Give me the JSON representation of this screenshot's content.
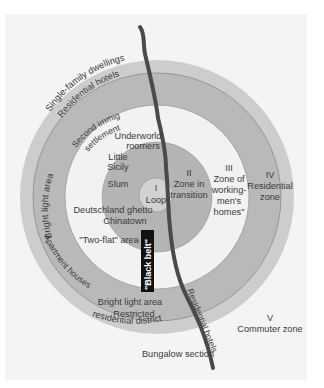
{
  "diagram": {
    "colors": {
      "page_bg": "#ffffff",
      "panel_bg": "#f4f4f4",
      "outer_band": "#cdcdcd",
      "zone_iv": "#b9b9b9",
      "zone_iii": "#f2f2f2",
      "zone_ii": "#b4b4b4",
      "loop": "#d2d2d2",
      "river": "#4a4a4a",
      "black_belt": "#111111",
      "text": "#3a3a3a"
    },
    "zones": [
      {
        "id": "I",
        "numeral": "I",
        "name": "Loop"
      },
      {
        "id": "II",
        "numeral": "II",
        "name_line1": "Zone in",
        "name_line2": "transition"
      },
      {
        "id": "III",
        "numeral": "III",
        "name_line1": "Zone of",
        "name_line2": "working-",
        "name_line3": "men's",
        "name_line4": "homes\""
      },
      {
        "id": "IV",
        "numeral": "IV",
        "name_line1": "Residential",
        "name_line2": "zone"
      },
      {
        "id": "V",
        "numeral": "V",
        "name": "Commuter zone"
      }
    ],
    "areas": {
      "underworld_1": "Underworld",
      "underworld_2": "roomers",
      "little_sicily_1": "Little",
      "little_sicily_2": "Sicily",
      "slum": "Slum",
      "deutschland": "Deutschland ghetto",
      "chinatown": "Chinatown",
      "two_flat": "\"Two-flat\" area",
      "black_belt": "\"Black belt\"",
      "second_immigrant_1": "Second immigrant",
      "second_immigrant_2": "settlement",
      "bright_light_west": "Bright light area",
      "apartment_houses": "Apartment houses",
      "single_family": "Single-family dwellings",
      "residential_hotels_north": "Residential hotels",
      "bright_light_south": "Bright light area",
      "restricted_1": "Restricted",
      "restricted_2": "residential district",
      "residential_hotels_river": "Residential hotels",
      "bungalow": "Bungalow section"
    }
  }
}
